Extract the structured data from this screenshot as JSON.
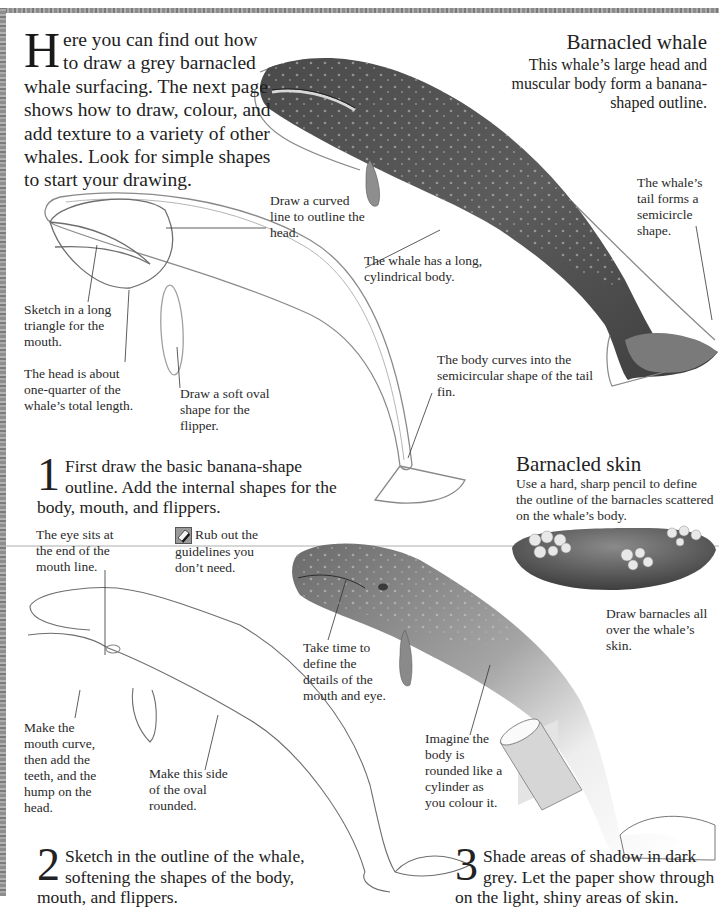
{
  "intro": {
    "dropcap": "H",
    "text": "ere you can find out how to draw a grey barnacled whale surfacing. The next page shows how to draw, colour, and add texture to a variety of other whales. Look for simple shapes to start your drawing."
  },
  "barnacled_whale": {
    "title": "Barnacled whale",
    "description": "This whale’s large head and muscular body form a banana-shaped outline."
  },
  "captions_top": {
    "tail_semicircle": "The whale’s tail forms a semicircle shape.",
    "curved_line_head": "Draw a curved line to outline the head.",
    "long_body": "The whale has a long, cylindrical body.",
    "mouth_triangle": "Sketch in a long triangle for the mouth.",
    "head_quarter": "The head is about one-quarter of the whale’s total length.",
    "oval_flipper": "Draw a soft oval shape for the flipper.",
    "body_curves": "The body curves into the semicircular shape of the tail fin."
  },
  "step1": {
    "number": "1",
    "text": "First draw the basic banana-shape outline. Add the internal shapes for the body, mouth, and flippers."
  },
  "barnacled_skin": {
    "title": "Barnacled skin",
    "description": "Use a hard, sharp pencil to define the outline of the barnacles scattered on the whale’s body.",
    "caption": "Draw barnacles all over the whale’s skin."
  },
  "captions_bottom": {
    "eye_position": "The eye sits at the end of the mouth line.",
    "rub_out": "Rub out the guidelines you don’t need.",
    "mouth_curve": "Make the mouth curve, then add the teeth, and the hump on the head.",
    "oval_rounded": "Make this side of the oval rounded.",
    "take_time": "Take time to define the details of the mouth and eye.",
    "imagine_cylinder": "Imagine the body is rounded like a cylinder as you colour it."
  },
  "step2": {
    "number": "2",
    "text": "Sketch in the outline of the whale, softening the shapes of the body, mouth, and flippers."
  },
  "step3": {
    "number": "3",
    "text": "Shade areas of shadow in dark grey. Let the paper show through on the light, shiny areas of skin."
  },
  "icons": {
    "eraser": "eraser-icon"
  },
  "colors": {
    "border": "#8c8c8c",
    "text": "#222222",
    "sketch_line": "#7a7a7a",
    "whale_dark": "#3a3a3a",
    "whale_light": "#bdbdbd"
  }
}
